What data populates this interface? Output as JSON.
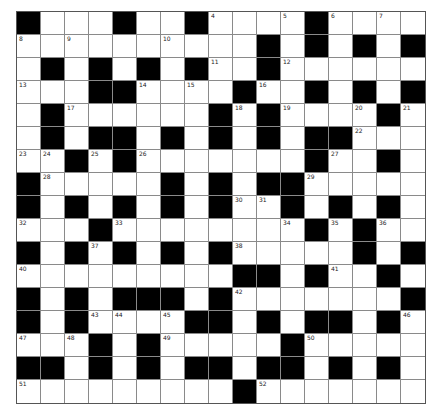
{
  "puzzle": {
    "rows": 17,
    "cols": 17,
    "colors": {
      "block": "#000000",
      "open": "#ffffff",
      "gridline": "#8a8a8a",
      "number": "#222222"
    },
    "layout": [
      "#...#..#....#....",
      "..........#.#.#.#",
      ".#.#.#.#..#......",
      "...##....#..#.#.#",
      ".#......#.#....#.",
      ".#.##.#.#.#.##...",
      "..#.#.......#..#.",
      "#.....#.#.##.....",
      "#.#.#.#.#..#.#.#.",
      "...#........#.#..",
      "#.#.#.#.#.....#.#",
      ".........##.#..#.",
      "#.#.###.#.......#",
      "#.#....##.#.##.#.",
      "...#.#.....#.....",
      "##.#.#.##.##.#.#.",
      ".........#......."
    ],
    "numbers": [
      {
        "r": 0,
        "c": 0,
        "n": "1"
      },
      {
        "r": 0,
        "c": 4,
        "n": "2"
      },
      {
        "r": 0,
        "c": 7,
        "n": "3"
      },
      {
        "r": 0,
        "c": 8,
        "n": "4"
      },
      {
        "r": 0,
        "c": 11,
        "n": "5"
      },
      {
        "r": 0,
        "c": 13,
        "n": "6"
      },
      {
        "r": 0,
        "c": 15,
        "n": "7"
      },
      {
        "r": 1,
        "c": 0,
        "n": "8"
      },
      {
        "r": 1,
        "c": 2,
        "n": "9"
      },
      {
        "r": 1,
        "c": 6,
        "n": "10"
      },
      {
        "r": 2,
        "c": 8,
        "n": "11"
      },
      {
        "r": 2,
        "c": 11,
        "n": "12"
      },
      {
        "r": 3,
        "c": 0,
        "n": "13"
      },
      {
        "r": 3,
        "c": 5,
        "n": "14"
      },
      {
        "r": 3,
        "c": 7,
        "n": "15"
      },
      {
        "r": 3,
        "c": 10,
        "n": "16"
      },
      {
        "r": 4,
        "c": 2,
        "n": "17"
      },
      {
        "r": 4,
        "c": 9,
        "n": "18"
      },
      {
        "r": 4,
        "c": 11,
        "n": "19"
      },
      {
        "r": 4,
        "c": 14,
        "n": "20"
      },
      {
        "r": 4,
        "c": 16,
        "n": "21"
      },
      {
        "r": 5,
        "c": 14,
        "n": "22"
      },
      {
        "r": 6,
        "c": 0,
        "n": "23"
      },
      {
        "r": 6,
        "c": 1,
        "n": "24"
      },
      {
        "r": 6,
        "c": 3,
        "n": "25"
      },
      {
        "r": 6,
        "c": 5,
        "n": "26"
      },
      {
        "r": 6,
        "c": 13,
        "n": "27"
      },
      {
        "r": 7,
        "c": 1,
        "n": "28"
      },
      {
        "r": 7,
        "c": 12,
        "n": "29"
      },
      {
        "r": 8,
        "c": 9,
        "n": "30"
      },
      {
        "r": 8,
        "c": 10,
        "n": "31"
      },
      {
        "r": 9,
        "c": 0,
        "n": "32"
      },
      {
        "r": 9,
        "c": 4,
        "n": "33"
      },
      {
        "r": 9,
        "c": 11,
        "n": "34"
      },
      {
        "r": 9,
        "c": 13,
        "n": "35"
      },
      {
        "r": 9,
        "c": 15,
        "n": "36"
      },
      {
        "r": 10,
        "c": 3,
        "n": "37"
      },
      {
        "r": 10,
        "c": 9,
        "n": "38"
      },
      {
        "r": 10,
        "c": 14,
        "n": "39"
      },
      {
        "r": 11,
        "c": 0,
        "n": "40"
      },
      {
        "r": 11,
        "c": 13,
        "n": "41"
      },
      {
        "r": 12,
        "c": 9,
        "n": "42"
      },
      {
        "r": 13,
        "c": 3,
        "n": "43"
      },
      {
        "r": 13,
        "c": 4,
        "n": "44"
      },
      {
        "r": 13,
        "c": 6,
        "n": "45"
      },
      {
        "r": 13,
        "c": 16,
        "n": "46"
      },
      {
        "r": 14,
        "c": 0,
        "n": "47"
      },
      {
        "r": 14,
        "c": 2,
        "n": "48"
      },
      {
        "r": 14,
        "c": 6,
        "n": "49"
      },
      {
        "r": 14,
        "c": 12,
        "n": "50"
      },
      {
        "r": 16,
        "c": 0,
        "n": "51"
      },
      {
        "r": 16,
        "c": 10,
        "n": "52"
      }
    ]
  }
}
